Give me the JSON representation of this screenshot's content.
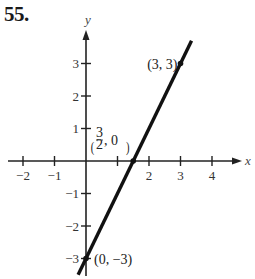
{
  "problem_number": "55.",
  "chart_data": {
    "type": "line",
    "title": "",
    "xlabel": "x",
    "ylabel": "y",
    "xlim": [
      -2.2,
      4.9
    ],
    "ylim": [
      -3.5,
      4.2
    ],
    "grid": false,
    "x_ticks": [
      -2,
      -1,
      1,
      2,
      3,
      4
    ],
    "x_tick_labels": [
      "−2",
      "−1",
      "",
      "2",
      "3",
      "4"
    ],
    "y_ticks": [
      -3,
      -2,
      -1,
      1,
      2,
      3
    ],
    "y_tick_labels": [
      "−3",
      "−2",
      "−1",
      "1",
      "2",
      "3"
    ],
    "series": [
      {
        "name": "y = 2x − 3",
        "x": [
          -0.25,
          3.35
        ],
        "y": [
          -3.5,
          3.7
        ]
      }
    ],
    "points": [
      {
        "x": 3,
        "y": 3,
        "label": "(3, 3)"
      },
      {
        "x": 1.5,
        "y": 0,
        "label": "(3/2, 0)"
      },
      {
        "x": 0,
        "y": -3,
        "label": "(0, −3)"
      }
    ],
    "annotations": [
      "(3, 3)",
      "(3/2, 0)",
      "(0, −3)"
    ]
  },
  "labels": {
    "pt_3_3": "(3, 3)",
    "pt_0_m3": "(0, −3)",
    "frac_num": "3",
    "frac_den": "2",
    "frac_rest": ", 0"
  }
}
